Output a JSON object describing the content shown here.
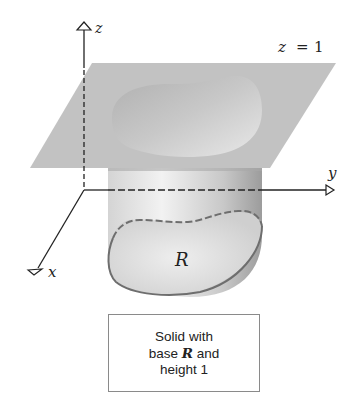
{
  "figure": {
    "axes": {
      "z_label": "z",
      "y_label": "y",
      "x_label": "x"
    },
    "plane_label": {
      "lhs": "z",
      "eq": "=",
      "rhs": "1"
    },
    "region_label": "R",
    "caption": {
      "line1": "Solid with",
      "line2_pre": "base ",
      "line2_var": "R",
      "line2_post": " and",
      "line3": "height 1"
    },
    "colors": {
      "plane": "#b9b9b9",
      "solid_light": "#e6e6e6",
      "solid_dark": "#9a9a9a",
      "outline": "#6e6e6e",
      "axis": "#222222"
    }
  }
}
